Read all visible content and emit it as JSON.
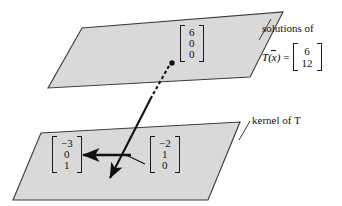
{
  "figure": {
    "background_color": "#ffffff",
    "plane_fill_color": "#d9d9d9",
    "plane_stroke_color": "#3a3a3a",
    "ink_color": "#111111"
  },
  "labels": {
    "solutions_of": "solutions of",
    "kernel_of_t": "kernel of T"
  },
  "equation": {
    "function_name": "T",
    "open_paren": "(",
    "variable": "x",
    "close_paren": ")",
    "equals": "=",
    "rhs_entries": [
      "6",
      "12"
    ]
  },
  "vectors": {
    "image_solution": {
      "name": "particular-solution-vector",
      "entries": [
        "6",
        "0",
        "0"
      ]
    },
    "kernel_left": {
      "name": "kernel-basis-vector-left",
      "entries": [
        "−3",
        "0",
        "1"
      ]
    },
    "kernel_right": {
      "name": "kernel-basis-vector-right",
      "entries": [
        "−2",
        "1",
        "0"
      ]
    }
  },
  "geometry": {
    "upper_plane_points": "82,28 283,12 250,77 48,88",
    "lower_plane_points": "41,133 240,122 208,200 13,200",
    "dot_point": {
      "x": 172,
      "y": 63
    },
    "dashed_segment": {
      "x1": 169,
      "y1": 66,
      "x2": 152,
      "y2": 96
    },
    "long_arrow": {
      "x1": 152,
      "y1": 96,
      "x2": 108,
      "y2": 181
    },
    "horizontal_arrow": {
      "x1": 130,
      "y1": 155,
      "x2": 80,
      "y2": 155
    },
    "pointer_tick": {
      "x1": 143,
      "y1": 163,
      "x2": 125,
      "y2": 155
    }
  }
}
